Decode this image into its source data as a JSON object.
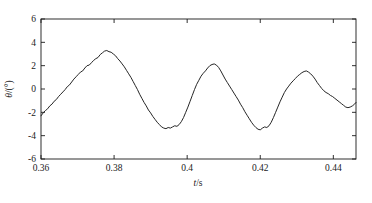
{
  "figure": {
    "background": "#ffffff",
    "line_color": "#262626",
    "axis_color": "#1a1a1a"
  },
  "chart_data": {
    "type": "line",
    "title": "",
    "subtitle": "",
    "xlabel": "t/s",
    "xlabel_italic_part": "t",
    "xlabel_rest": "/s",
    "ylabel": "θ/(°)",
    "ylabel_italic_part": "θ",
    "ylabel_rest": "/(°)",
    "xlim": [
      0.36,
      0.4462
    ],
    "ylim": [
      -6,
      6
    ],
    "xticks": [
      0.36,
      0.38,
      0.4,
      0.42,
      0.44
    ],
    "xticklabels": [
      "0.36",
      "0.38",
      "0.4",
      "0.42",
      "0.44"
    ],
    "yticks": [
      -6,
      -4,
      -2,
      0,
      2,
      4,
      6
    ],
    "yticklabels": [
      "-6",
      "-4",
      "-2",
      "0",
      "2",
      "4",
      "6"
    ],
    "grid": false,
    "legend": null,
    "legend_position": "none",
    "series": [
      {
        "name": "theta",
        "x": [
          0.36,
          0.3606,
          0.3612,
          0.3618,
          0.3624,
          0.363,
          0.3636,
          0.3642,
          0.3648,
          0.3654,
          0.366,
          0.3666,
          0.3672,
          0.3678,
          0.3684,
          0.369,
          0.3696,
          0.3702,
          0.3708,
          0.3714,
          0.372,
          0.3726,
          0.3732,
          0.3738,
          0.3744,
          0.375,
          0.3756,
          0.3762,
          0.3768,
          0.3774,
          0.378,
          0.3786,
          0.3792,
          0.3798,
          0.3804,
          0.381,
          0.3816,
          0.3822,
          0.3828,
          0.3834,
          0.384,
          0.3846,
          0.3852,
          0.3858,
          0.3864,
          0.387,
          0.3876,
          0.3882,
          0.3888,
          0.3894,
          0.39,
          0.3906,
          0.3912,
          0.3918,
          0.3924,
          0.393,
          0.3936,
          0.3942,
          0.3948,
          0.3954,
          0.396,
          0.3966,
          0.3972,
          0.3978,
          0.3984,
          0.399,
          0.3996,
          0.4002,
          0.4008,
          0.4014,
          0.402,
          0.4026,
          0.4032,
          0.4038,
          0.4044,
          0.405,
          0.4056,
          0.4062,
          0.4068,
          0.4074,
          0.408,
          0.4086,
          0.4092,
          0.4098,
          0.4104,
          0.411,
          0.4116,
          0.4122,
          0.4128,
          0.4134,
          0.414,
          0.4146,
          0.4152,
          0.4158,
          0.4164,
          0.417,
          0.4176,
          0.4182,
          0.4188,
          0.4194,
          0.42,
          0.4206,
          0.4212,
          0.4218,
          0.4224,
          0.423,
          0.4236,
          0.4242,
          0.4248,
          0.4254,
          0.426,
          0.4266,
          0.4272,
          0.4278,
          0.4284,
          0.429,
          0.4296,
          0.4302,
          0.4308,
          0.4314,
          0.432,
          0.4326,
          0.4332,
          0.4338,
          0.4344,
          0.435,
          0.4356,
          0.4362,
          0.4368,
          0.4374,
          0.438,
          0.4386,
          0.4392,
          0.4398,
          0.4404,
          0.441,
          0.4416,
          0.4422,
          0.4428,
          0.4434,
          0.444,
          0.4446,
          0.4452,
          0.4458,
          0.4462
        ],
        "y": [
          -2.3,
          -2.05,
          -1.85,
          -1.7,
          -1.45,
          -1.3,
          -1.05,
          -0.9,
          -0.65,
          -0.45,
          -0.25,
          -0.05,
          0.2,
          0.35,
          0.6,
          0.85,
          1.05,
          1.25,
          1.45,
          1.55,
          1.8,
          2.0,
          2.05,
          2.25,
          2.45,
          2.6,
          2.7,
          2.95,
          3.1,
          3.25,
          3.3,
          3.2,
          3.15,
          3.0,
          2.85,
          2.6,
          2.4,
          2.15,
          1.9,
          1.6,
          1.3,
          1.0,
          0.65,
          0.3,
          -0.05,
          -0.45,
          -0.8,
          -1.15,
          -1.45,
          -1.8,
          -2.05,
          -2.35,
          -2.6,
          -2.85,
          -3.05,
          -3.25,
          -3.35,
          -3.4,
          -3.3,
          -3.35,
          -3.25,
          -3.15,
          -3.2,
          -3.05,
          -2.8,
          -2.45,
          -2.0,
          -1.55,
          -1.05,
          -0.55,
          -0.05,
          0.4,
          0.75,
          1.1,
          1.35,
          1.55,
          1.8,
          2.0,
          2.1,
          2.15,
          2.05,
          1.85,
          1.55,
          1.2,
          0.85,
          0.55,
          0.25,
          -0.05,
          -0.35,
          -0.65,
          -0.95,
          -1.3,
          -1.6,
          -1.95,
          -2.25,
          -2.55,
          -2.85,
          -3.1,
          -3.3,
          -3.45,
          -3.5,
          -3.35,
          -3.25,
          -3.3,
          -3.15,
          -2.85,
          -2.45,
          -2.0,
          -1.55,
          -1.1,
          -0.7,
          -0.3,
          0.0,
          0.25,
          0.5,
          0.7,
          0.9,
          1.1,
          1.25,
          1.4,
          1.5,
          1.55,
          1.45,
          1.3,
          1.1,
          0.85,
          0.55,
          0.3,
          0.05,
          -0.15,
          -0.3,
          -0.4,
          -0.55,
          -0.65,
          -0.8,
          -0.95,
          -1.1,
          -1.25,
          -1.4,
          -1.55,
          -1.6,
          -1.55,
          -1.45,
          -1.3,
          -1.15
        ]
      }
    ],
    "peaks": [
      {
        "x": 0.3715,
        "y": 3.3
      },
      {
        "x": 0.3885,
        "y": 2.15
      },
      {
        "x": 0.4025,
        "y": 1.55
      },
      {
        "x": 0.4145,
        "y": 1.7
      },
      {
        "x": 0.4285,
        "y": 2.2
      },
      {
        "x": 0.4415,
        "y": 1.95
      }
    ],
    "valleys": [
      {
        "x": 0.36,
        "y": -2.3
      },
      {
        "x": 0.3825,
        "y": -3.4
      },
      {
        "x": 0.3955,
        "y": -3.5
      },
      {
        "x": 0.4075,
        "y": -1.62
      },
      {
        "x": 0.421,
        "y": -1.9
      },
      {
        "x": 0.4355,
        "y": -2.5
      },
      {
        "x": 0.4462,
        "y": -0.85
      }
    ]
  }
}
